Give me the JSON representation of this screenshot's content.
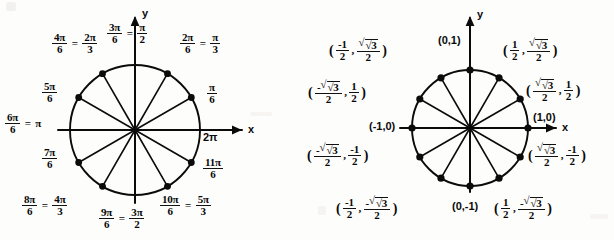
{
  "figure_left": {
    "name": "unit-circle-radian-measures",
    "axis_x_label": "x",
    "axis_y_label": "y",
    "x_axis_tick_label": "2π",
    "angles": [
      {
        "id": "pi-over-6",
        "deg": 30,
        "num": "π",
        "den": "6",
        "alt_num": "",
        "alt_den": "",
        "plain": ""
      },
      {
        "id": "2pi-over-6",
        "deg": 60,
        "num": "2π",
        "den": "6",
        "alt_num": "π",
        "alt_den": "3",
        "plain": ""
      },
      {
        "id": "3pi-over-6",
        "deg": 90,
        "num": "3π",
        "den": "6",
        "alt_num": "π",
        "alt_den": "2",
        "plain": ""
      },
      {
        "id": "4pi-over-6",
        "deg": 120,
        "num": "4π",
        "den": "6",
        "alt_num": "2π",
        "alt_den": "3",
        "plain": ""
      },
      {
        "id": "5pi-over-6",
        "deg": 150,
        "num": "5π",
        "den": "6",
        "alt_num": "",
        "alt_den": "",
        "plain": ""
      },
      {
        "id": "6pi-over-6",
        "deg": 180,
        "num": "6π",
        "den": "6",
        "alt_num": "",
        "alt_den": "",
        "plain": "π"
      },
      {
        "id": "7pi-over-6",
        "deg": 210,
        "num": "7π",
        "den": "6",
        "alt_num": "",
        "alt_den": "",
        "plain": ""
      },
      {
        "id": "8pi-over-6",
        "deg": 240,
        "num": "8π",
        "den": "6",
        "alt_num": "4π",
        "alt_den": "3",
        "plain": ""
      },
      {
        "id": "9pi-over-6",
        "deg": 270,
        "num": "9π",
        "den": "6",
        "alt_num": "3π",
        "alt_den": "2",
        "plain": ""
      },
      {
        "id": "10pi-over-6",
        "deg": 300,
        "num": "10π",
        "den": "6",
        "alt_num": "5π",
        "alt_den": "3",
        "plain": ""
      },
      {
        "id": "11pi-over-6",
        "deg": 330,
        "num": "11π",
        "den": "6",
        "alt_num": "",
        "alt_den": "",
        "plain": ""
      }
    ],
    "equals_sign": "="
  },
  "figure_right": {
    "name": "unit-circle-coordinates",
    "axis_x_label": "x",
    "axis_y_label": "y",
    "points": [
      {
        "id": "p-0deg",
        "deg": 0,
        "text": "(1,0)"
      },
      {
        "id": "p-90deg",
        "deg": 90,
        "text": "(0,1)"
      },
      {
        "id": "p-180deg",
        "deg": 180,
        "text": "(-1,0)"
      },
      {
        "id": "p-270deg",
        "deg": 270,
        "text": "(0,-1)"
      }
    ],
    "coord_30": {
      "x_num": "√3",
      "x_den": "2",
      "y_num": "1",
      "y_den": "2",
      "x_sign": "",
      "y_sign": ""
    },
    "coord_60": {
      "x_num": "1",
      "x_den": "2",
      "y_num": "√3",
      "y_den": "2",
      "x_sign": "",
      "y_sign": ""
    },
    "coord_120": {
      "x_num": "1",
      "x_den": "2",
      "y_num": "√3",
      "y_den": "2",
      "x_sign": "-",
      "y_sign": ""
    },
    "coord_150": {
      "x_num": "√3",
      "x_den": "2",
      "y_num": "1",
      "y_den": "2",
      "x_sign": "-",
      "y_sign": ""
    },
    "coord_210": {
      "x_num": "√3",
      "x_den": "2",
      "y_num": "1",
      "y_den": "2",
      "x_sign": "-",
      "y_sign": "-"
    },
    "coord_240": {
      "x_num": "1",
      "x_den": "2",
      "y_num": "√3",
      "y_den": "2",
      "x_sign": "-",
      "y_sign": "-"
    },
    "coord_300": {
      "x_num": "1",
      "x_den": "2",
      "y_num": "√3",
      "y_den": "2",
      "x_sign": "",
      "y_sign": "-"
    },
    "coord_330": {
      "x_num": "√3",
      "x_den": "2",
      "y_num": "1",
      "y_den": "2",
      "x_sign": "",
      "y_sign": "-"
    },
    "comma": ",",
    "lparen": "(",
    "rparen": ")"
  },
  "colors": {
    "ink": "#000000",
    "background": "#fdfdfc"
  }
}
